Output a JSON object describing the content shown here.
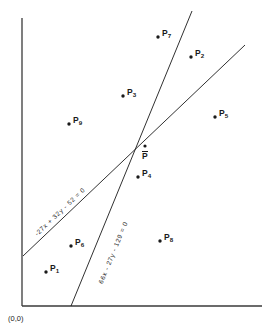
{
  "figure": {
    "type": "scatter-with-regression-lines",
    "background_color": "#ffffff",
    "ink_color": "#1a1a1a",
    "origin_label": "(0,0)",
    "width": 270,
    "height": 334
  },
  "axes": {
    "x_axis": {
      "name": "x-axis",
      "x1": 22,
      "y1": 306,
      "x2": 262,
      "y2": 306
    },
    "y_axis": {
      "name": "y-axis",
      "x1": 22,
      "y1": 306,
      "x2": 22,
      "y2": 18
    },
    "ticks_shown": false,
    "gridlines": false,
    "tick_labels": []
  },
  "chart_data": {
    "type": "scatter",
    "title": "",
    "xlabel": "",
    "ylabel": "",
    "xlim": [
      22,
      262
    ],
    "ylim": [
      306,
      18
    ],
    "grid": false,
    "legend": "none",
    "annotations": [
      "-27x + 32y - 52 = 0",
      "66x - 27y - 129 = 0",
      "(0,0)"
    ],
    "points": [
      {
        "label": "P",
        "subscript": "1",
        "x": 46,
        "y": 272,
        "label_dx": 4,
        "label_dy": -5
      },
      {
        "label": "P",
        "subscript": "2",
        "x": 191,
        "y": 57,
        "label_dx": 4,
        "label_dy": -5
      },
      {
        "label": "P",
        "subscript": "3",
        "x": 123,
        "y": 96,
        "label_dx": 4,
        "label_dy": -5
      },
      {
        "label": "P",
        "subscript": "4",
        "x": 138,
        "y": 177,
        "label_dx": 4,
        "label_dy": -5
      },
      {
        "label": "P",
        "subscript": "5",
        "x": 215,
        "y": 117,
        "label_dx": 4,
        "label_dy": -5
      },
      {
        "label": "P",
        "subscript": "6",
        "x": 71,
        "y": 246,
        "label_dx": 4,
        "label_dy": -5
      },
      {
        "label": "P",
        "subscript": "7",
        "x": 158,
        "y": 37,
        "label_dx": 4,
        "label_dy": -5
      },
      {
        "label": "P",
        "subscript": "8",
        "x": 160,
        "y": 241,
        "label_dx": 4,
        "label_dy": -5
      },
      {
        "label": "P",
        "subscript": "9",
        "x": 69,
        "y": 124,
        "label_dx": 4,
        "label_dy": -5
      }
    ],
    "mean_point": {
      "label": "P",
      "overline": true,
      "x": 145,
      "y": 146,
      "label_dx": -3,
      "label_dy": 5
    },
    "lines": [
      {
        "name": "shallow-regression-line",
        "equation": "-27x + 32y - 52 = 0",
        "x1": 23,
        "y1": 256,
        "x2": 245,
        "y2": 45,
        "label_x": 33,
        "label_y": 232,
        "label_rotation": -43.5
      },
      {
        "name": "steep-regression-line",
        "equation": "66x - 27y - 129 = 0",
        "x1": 71,
        "y1": 306,
        "x2": 192,
        "y2": 11,
        "label_x": 97,
        "label_y": 282,
        "label_rotation": -67.8
      }
    ]
  }
}
